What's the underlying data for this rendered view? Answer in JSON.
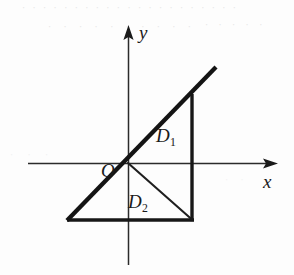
{
  "figure": {
    "width": 294,
    "height": 275,
    "background_color": "#fdfdfd",
    "ink_color": "#1a1a1a"
  },
  "axes": {
    "x_label": "x",
    "y_label": "y",
    "origin_label": "O",
    "origin_px": {
      "x": 128,
      "y": 163
    },
    "x_axis": {
      "from_px": 28,
      "to_px": 278,
      "y_px": 163,
      "arrow": "right",
      "stroke_width": 1.4
    },
    "y_axis": {
      "from_px": 265,
      "to_px": 25,
      "x_px": 128,
      "arrow": "up",
      "stroke_width": 1.4
    }
  },
  "regions": [
    {
      "id": "D1",
      "label": "D",
      "subscript": "1",
      "description": "upper triangle bounded by line y=x, vertical right edge and x-axis"
    },
    {
      "id": "D2",
      "label": "D",
      "subscript": "2",
      "description": "lower triangle bounded by x-axis, vertical right edge and thin diagonal"
    }
  ],
  "strokes": {
    "diagonal_thick": {
      "name": "line-y-equals-x",
      "from_px": {
        "x": 68,
        "y": 220
      },
      "to_px": {
        "x": 216,
        "y": 67
      },
      "stroke_width": 4.2
    },
    "right_vertical": {
      "name": "right-edge",
      "from_px": {
        "x": 192,
        "y": 95
      },
      "to_px": {
        "x": 192,
        "y": 221
      },
      "stroke_width": 3.4
    },
    "base_horizontal": {
      "name": "base-edge",
      "from_px": {
        "x": 67,
        "y": 220
      },
      "to_px": {
        "x": 194,
        "y": 220
      },
      "stroke_width": 3.4
    },
    "diagonal_thin": {
      "name": "hypotenuse-d2",
      "from_px": {
        "x": 128,
        "y": 163
      },
      "to_px": {
        "x": 192,
        "y": 220
      },
      "stroke_width": 2.0
    }
  },
  "artifacts": {
    "row_1": "· · · · · · · · · · · · · · · · · · · · ·",
    "row_2": "· · · · · · · · · ·",
    "row_3": "· · · · ·",
    "row_4": "· · ·",
    "row_5": "· ·"
  }
}
